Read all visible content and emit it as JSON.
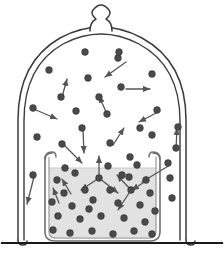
{
  "figure": {
    "width": 224,
    "height": 263,
    "background_color": "#ffffff"
  },
  "colors": {
    "outline": "#3b3b3b",
    "particle": "#4a4a4a",
    "particle_stroke": "#2e2e2e",
    "liquid_fill": "#e2e2e2",
    "vapor_fill": "#ffffff",
    "arrow": "#555555",
    "ground_line": "#1a1a1a",
    "beaker_glass": "#9a9a9a"
  },
  "bell_jar": {
    "name": "bell-jar",
    "knob": {
      "name": "bell-jar-knob",
      "center_x": 101,
      "top_y": 8
    },
    "dome": {
      "left_x": 18,
      "right_x": 186,
      "apex_y": 28,
      "shoulder_y": 95,
      "foot_y": 238
    },
    "wall_style": "double-line"
  },
  "beaker": {
    "name": "beaker",
    "left_x": 47,
    "right_x": 158,
    "rim_y": 152,
    "base_y": 241,
    "liquid_surface_y": 168,
    "rim_style": "rolled-lip"
  },
  "ground": {
    "name": "ground-line",
    "y": 243,
    "x_start": 2,
    "x_end": 222
  },
  "particles": {
    "radius": 3.4,
    "vapor": [
      {
        "x": 85,
        "y": 52
      },
      {
        "x": 118,
        "y": 58
      },
      {
        "x": 49,
        "y": 70
      },
      {
        "x": 88,
        "y": 78
      },
      {
        "x": 152,
        "y": 74
      },
      {
        "x": 121,
        "y": 87
      },
      {
        "x": 61,
        "y": 97
      },
      {
        "x": 99,
        "y": 97
      },
      {
        "x": 33,
        "y": 108
      },
      {
        "x": 76,
        "y": 111
      },
      {
        "x": 107,
        "y": 114
      },
      {
        "x": 157,
        "y": 110
      },
      {
        "x": 140,
        "y": 128
      },
      {
        "x": 82,
        "y": 128
      },
      {
        "x": 37,
        "y": 137
      },
      {
        "x": 62,
        "y": 144
      },
      {
        "x": 110,
        "y": 143
      },
      {
        "x": 152,
        "y": 135
      },
      {
        "x": 178,
        "y": 127
      },
      {
        "x": 176,
        "y": 148
      },
      {
        "x": 168,
        "y": 163
      },
      {
        "x": 33,
        "y": 175
      },
      {
        "x": 170,
        "y": 178
      },
      {
        "x": 172,
        "y": 198
      },
      {
        "x": 130,
        "y": 157
      },
      {
        "x": 119,
        "y": 52
      }
    ],
    "liquid": [
      {
        "x": 57,
        "y": 180
      },
      {
        "x": 75,
        "y": 173
      },
      {
        "x": 99,
        "y": 178
      },
      {
        "x": 122,
        "y": 175
      },
      {
        "x": 146,
        "y": 180
      },
      {
        "x": 137,
        "y": 165
      },
      {
        "x": 64,
        "y": 193
      },
      {
        "x": 85,
        "y": 190
      },
      {
        "x": 110,
        "y": 190
      },
      {
        "x": 131,
        "y": 190
      },
      {
        "x": 150,
        "y": 193
      },
      {
        "x": 52,
        "y": 202
      },
      {
        "x": 72,
        "y": 206
      },
      {
        "x": 93,
        "y": 200
      },
      {
        "x": 118,
        "y": 203
      },
      {
        "x": 140,
        "y": 205
      },
      {
        "x": 155,
        "y": 211
      },
      {
        "x": 58,
        "y": 216
      },
      {
        "x": 80,
        "y": 219
      },
      {
        "x": 101,
        "y": 216
      },
      {
        "x": 124,
        "y": 218
      },
      {
        "x": 145,
        "y": 222
      },
      {
        "x": 53,
        "y": 230
      },
      {
        "x": 70,
        "y": 233
      },
      {
        "x": 92,
        "y": 231
      },
      {
        "x": 113,
        "y": 234
      },
      {
        "x": 134,
        "y": 231
      },
      {
        "x": 152,
        "y": 234
      },
      {
        "x": 65,
        "y": 168
      },
      {
        "x": 108,
        "y": 166
      },
      {
        "x": 89,
        "y": 209
      },
      {
        "x": 129,
        "y": 177
      }
    ]
  },
  "arrows": {
    "vapor": [
      {
        "name": "arrow-down-left",
        "x1": 126,
        "y1": 62,
        "x2": 105,
        "y2": 77
      },
      {
        "name": "arrow-up",
        "x1": 62,
        "y1": 97,
        "x2": 67,
        "y2": 79
      },
      {
        "name": "arrow-right",
        "x1": 126,
        "y1": 89,
        "x2": 150,
        "y2": 89
      },
      {
        "name": "arrow-up-right",
        "x1": 107,
        "y1": 114,
        "x2": 99,
        "y2": 96
      },
      {
        "name": "arrow-down-left-2",
        "x1": 160,
        "y1": 111,
        "x2": 139,
        "y2": 122
      },
      {
        "name": "arrow-right-low",
        "x1": 36,
        "y1": 110,
        "x2": 57,
        "y2": 119
      },
      {
        "name": "arrow-down-right-rim",
        "x1": 64,
        "y1": 145,
        "x2": 82,
        "y2": 163
      },
      {
        "name": "arrow-down-rim",
        "x1": 83,
        "y1": 130,
        "x2": 84,
        "y2": 153
      },
      {
        "name": "arrow-up-right-2",
        "x1": 113,
        "y1": 145,
        "x2": 124,
        "y2": 128
      },
      {
        "name": "arrow-up-right-3",
        "x1": 176,
        "y1": 150,
        "x2": 177,
        "y2": 128
      },
      {
        "name": "arrow-down-left-3",
        "x1": 34,
        "y1": 177,
        "x2": 27,
        "y2": 204
      },
      {
        "name": "arrow-down-right-into-beaker",
        "x1": 170,
        "y1": 165,
        "x2": 142,
        "y2": 182
      }
    ],
    "liquid": [
      {
        "name": "arrow-evaporate-up",
        "x1": 99,
        "y1": 178,
        "x2": 99,
        "y2": 156
      },
      {
        "name": "arrow-branch-left",
        "x1": 99,
        "y1": 178,
        "x2": 81,
        "y2": 190
      },
      {
        "name": "arrow-branch-right",
        "x1": 99,
        "y1": 178,
        "x2": 118,
        "y2": 193
      },
      {
        "name": "arrow-up-left-liquid",
        "x1": 71,
        "y1": 194,
        "x2": 62,
        "y2": 179
      },
      {
        "name": "arrow-up-small-liquid",
        "x1": 59,
        "y1": 203,
        "x2": 53,
        "y2": 188
      },
      {
        "name": "arrow-collide-a",
        "x1": 131,
        "y1": 190,
        "x2": 117,
        "y2": 175
      },
      {
        "name": "arrow-collide-b",
        "x1": 131,
        "y1": 190,
        "x2": 118,
        "y2": 210
      },
      {
        "name": "arrow-collide-c",
        "x1": 146,
        "y1": 181,
        "x2": 132,
        "y2": 190
      }
    ]
  }
}
